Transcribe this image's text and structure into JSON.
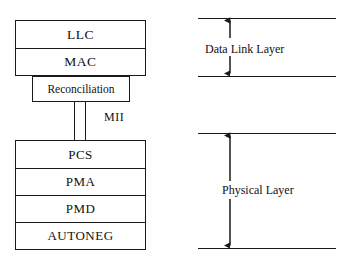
{
  "diagram": {
    "upper_stack": {
      "layers": [
        {
          "label": "LLC"
        },
        {
          "label": "MAC"
        }
      ]
    },
    "reconciliation": {
      "label": "Reconciliation"
    },
    "interface": {
      "label": "MII"
    },
    "lower_stack": {
      "layers": [
        {
          "label": "PCS"
        },
        {
          "label": "PMA"
        },
        {
          "label": "PMD"
        },
        {
          "label": "AUTONEG"
        }
      ]
    },
    "annotations": [
      {
        "label": "Data Link Layer"
      },
      {
        "label": "Physical Layer"
      }
    ],
    "colors": {
      "stroke": "#1a1a1a",
      "text": "#111111",
      "background": "#ffffff"
    }
  }
}
